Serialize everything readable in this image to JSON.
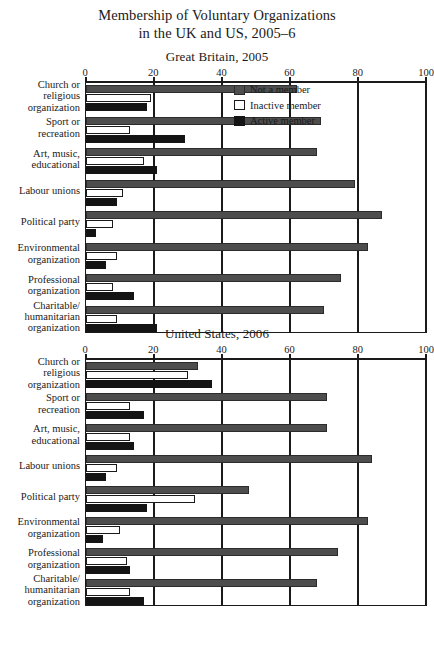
{
  "title": {
    "line1": "Membership of Voluntary Organizations",
    "line2": "in the UK and US, 2005–6"
  },
  "legend": {
    "items": [
      {
        "label": "Not a member",
        "key": "notamember",
        "color": "#4d4d4d"
      },
      {
        "label": "Inactive member",
        "key": "inactive",
        "color": "#ffffff"
      },
      {
        "label": "Active member",
        "key": "active",
        "color": "#141414"
      }
    ]
  },
  "chart_data": [
    {
      "type": "bar",
      "title": "Great Britain, 2005",
      "orientation": "horizontal",
      "grouped": true,
      "xlabel": "",
      "ylabel": "",
      "xlim": [
        0,
        100
      ],
      "xticks": [
        0,
        20,
        40,
        60,
        80,
        100
      ],
      "grid": true,
      "legend_position": "top-right",
      "categories": [
        "Church or religious organization",
        "Sport or recreation",
        "Art, music, educational",
        "Labour unions",
        "Political party",
        "Environmental organization",
        "Professional organization",
        "Charitable/ humanitarian organization"
      ],
      "category_lines": [
        [
          "Church or",
          "religious",
          "organization"
        ],
        [
          "Sport or",
          "recreation"
        ],
        [
          "Art, music,",
          "educational"
        ],
        [
          "Labour unions"
        ],
        [
          "Political party"
        ],
        [
          "Environmental",
          "organization"
        ],
        [
          "Professional",
          "organization"
        ],
        [
          "Charitable/",
          "humanitarian",
          "organization"
        ]
      ],
      "series": [
        {
          "name": "Not a member",
          "values": [
            62,
            69,
            68,
            79,
            87,
            83,
            75,
            70
          ]
        },
        {
          "name": "Inactive member",
          "values": [
            19,
            13,
            17,
            11,
            8,
            9,
            8,
            9
          ]
        },
        {
          "name": "Active member",
          "values": [
            18,
            29,
            21,
            9,
            3,
            6,
            14,
            21
          ]
        }
      ]
    },
    {
      "type": "bar",
      "title": "United States, 2006",
      "orientation": "horizontal",
      "grouped": true,
      "xlabel": "",
      "ylabel": "",
      "xlim": [
        0,
        100
      ],
      "xticks": [
        0,
        20,
        40,
        60,
        80,
        100
      ],
      "grid": true,
      "legend_position": "none",
      "categories": [
        "Church or religious organization",
        "Sport or recreation",
        "Art, music, educational",
        "Labour unions",
        "Political party",
        "Environmental organization",
        "Professional organization",
        "Charitable/ humanitarian organization"
      ],
      "category_lines": [
        [
          "Church or",
          "religious",
          "organization"
        ],
        [
          "Sport or",
          "recreation"
        ],
        [
          "Art, music,",
          "educational"
        ],
        [
          "Labour unions"
        ],
        [
          "Political party"
        ],
        [
          "Environmental",
          "organization"
        ],
        [
          "Professional",
          "organization"
        ],
        [
          "Charitable/",
          "humanitarian",
          "organization"
        ]
      ],
      "series": [
        {
          "name": "Not a member",
          "values": [
            33,
            71,
            71,
            84,
            48,
            83,
            74,
            68
          ]
        },
        {
          "name": "Inactive member",
          "values": [
            30,
            13,
            13,
            9,
            32,
            10,
            12,
            13
          ]
        },
        {
          "name": "Active member",
          "values": [
            37,
            17,
            14,
            6,
            18,
            5,
            13,
            17
          ]
        }
      ]
    }
  ]
}
